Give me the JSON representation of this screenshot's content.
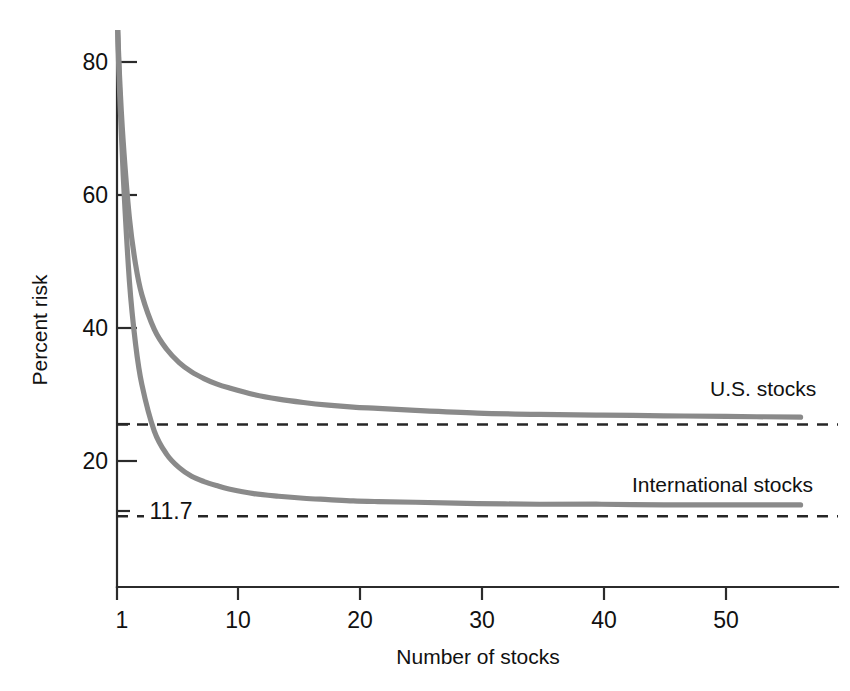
{
  "chart_data": {
    "type": "line",
    "title": "",
    "xlabel": "Number of stocks",
    "ylabel": "Percent risk",
    "xlim": [
      1,
      57
    ],
    "ylim": [
      0,
      87
    ],
    "grid": false,
    "legend_position": "inline-right",
    "xticks": [
      1,
      10,
      20,
      30,
      40,
      50
    ],
    "xtick_labels": [
      "1",
      "10",
      "20",
      "30",
      "40",
      "50"
    ],
    "yticks": [
      20,
      40,
      60,
      80
    ],
    "ytick_labels": [
      "20",
      "40",
      "60",
      "80"
    ],
    "annotations": [
      {
        "text": "11.7",
        "x": 2.6,
        "y": 11.7
      }
    ],
    "reference_lines": [
      {
        "name": "us-systematic-risk",
        "value": 25.5,
        "label": "",
        "style": "dashed"
      },
      {
        "name": "international-systematic-risk",
        "value": 11.7,
        "label": "11.7",
        "style": "dashed"
      }
    ],
    "series": [
      {
        "name": "U.S. stocks",
        "color": "#8a8a8a",
        "label_x": 48,
        "label_y": 30.0,
        "asymptote": 26.6,
        "x": [
          1,
          1.2,
          1.5,
          2,
          2.5,
          3,
          4,
          5,
          6,
          7,
          8,
          9,
          10,
          12,
          14,
          16,
          18,
          20,
          22,
          25,
          30,
          35,
          40,
          45,
          50,
          56
        ],
        "y": [
          88.0,
          78.0,
          68.0,
          56.5,
          49.5,
          45.0,
          39.8,
          36.8,
          34.8,
          33.4,
          32.4,
          31.6,
          31.0,
          30.0,
          29.3,
          28.8,
          28.4,
          28.1,
          27.9,
          27.6,
          27.2,
          27.0,
          26.9,
          26.8,
          26.7,
          26.6
        ]
      },
      {
        "name": "International stocks",
        "color": "#8a8a8a",
        "label_x": 43,
        "label_y": 17.0,
        "asymptote": 13.4,
        "x": [
          1,
          1.2,
          1.5,
          2,
          2.5,
          3,
          4,
          5,
          6,
          7,
          8,
          9,
          10,
          12,
          14,
          16,
          18,
          20,
          22,
          25,
          30,
          35,
          40,
          45,
          50,
          56
        ],
        "y": [
          88.0,
          76.0,
          63.0,
          47.0,
          37.5,
          31.5,
          24.5,
          21.0,
          19.0,
          17.7,
          16.9,
          16.3,
          15.8,
          15.1,
          14.7,
          14.4,
          14.2,
          14.0,
          13.9,
          13.8,
          13.6,
          13.5,
          13.5,
          13.4,
          13.4,
          13.4
        ]
      }
    ]
  },
  "figure": {
    "background_color": "#ffffff",
    "axis_color": "#2b2b2b",
    "curve_color": "#8a8a8a",
    "dash_color": "#262626"
  }
}
